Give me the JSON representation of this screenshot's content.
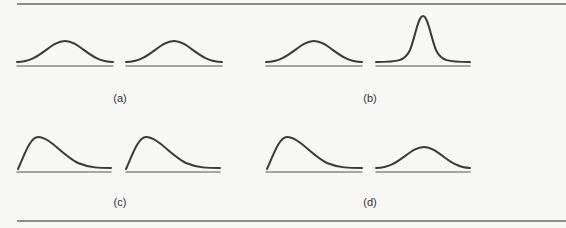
{
  "figure": {
    "panels": [
      {
        "id": "a",
        "label": "(a)",
        "left_curve": "normal (same spread)",
        "right_curve": "normal (same spread)"
      },
      {
        "id": "b",
        "label": "(b)",
        "left_curve": "normal (wide spread)",
        "right_curve": "normal (narrow spread, tall peak)"
      },
      {
        "id": "c",
        "label": "(c)",
        "left_curve": "right-skewed",
        "right_curve": "right-skewed"
      },
      {
        "id": "d",
        "label": "(d)",
        "left_curve": "right-skewed",
        "right_curve": "normal (wide spread)"
      }
    ],
    "colors": {
      "curve": "#3a3a3a",
      "baseline": "#8a8a8a",
      "rule": "#8a8a8a",
      "background": "#f7f7f5"
    }
  }
}
